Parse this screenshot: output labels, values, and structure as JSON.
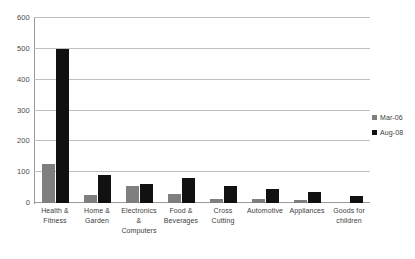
{
  "chart_data": {
    "type": "bar",
    "title": "",
    "xlabel": "",
    "ylabel": "",
    "ylim": [
      0,
      600
    ],
    "ytick_step": 100,
    "yticks": [
      0,
      100,
      200,
      300,
      400,
      500,
      600
    ],
    "grid": true,
    "legend_position": "right",
    "categories": [
      "Health & Fitness",
      "Home & Garden",
      "Electronics & Computers",
      "Food & Beverages",
      "Cross Cutting",
      "Automotive",
      "Appliances",
      "Goods for children"
    ],
    "category_lines": [
      [
        "Health &",
        "Fitness"
      ],
      [
        "Home &",
        "Garden"
      ],
      [
        "Electronics &",
        "Computers"
      ],
      [
        "Food &",
        "Beverages"
      ],
      [
        "Cross",
        "Cutting"
      ],
      [
        "Automotive",
        ""
      ],
      [
        "Appliances",
        ""
      ],
      [
        "Goods for",
        "children"
      ]
    ],
    "series": [
      {
        "name": "Mar-06",
        "color": "#7f7f7f",
        "values": [
          125,
          25,
          55,
          30,
          12,
          12,
          10,
          0
        ]
      },
      {
        "name": "Aug-08",
        "color": "#111111",
        "values": [
          500,
          90,
          62,
          80,
          55,
          45,
          35,
          22
        ]
      }
    ]
  }
}
